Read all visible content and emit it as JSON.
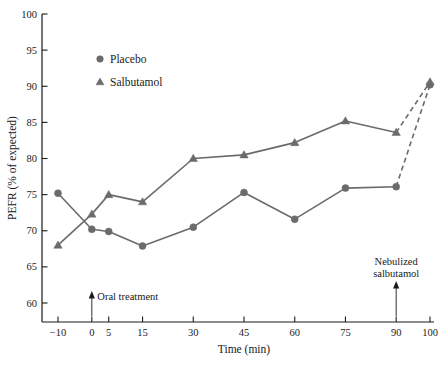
{
  "chart_data": {
    "type": "line",
    "title": "",
    "xlabel": "Time (min)",
    "ylabel": "PEFR (% of expected)",
    "xlim": [
      -14,
      104
    ],
    "ylim": [
      57,
      100
    ],
    "xticks": [
      -10,
      0,
      5,
      15,
      30,
      45,
      60,
      75,
      90,
      100
    ],
    "xtick_labels": [
      "−10",
      "0",
      "5",
      "15",
      "30",
      "45",
      "60",
      "75",
      "90",
      "100"
    ],
    "yticks": [
      60,
      65,
      70,
      75,
      80,
      85,
      90,
      95,
      100
    ],
    "ytick_labels": [
      "60",
      "65",
      "70",
      "75",
      "80",
      "85",
      "90",
      "95",
      "100"
    ],
    "grid": false,
    "legend_position": "upper-left-inside",
    "x": [
      -10,
      0,
      5,
      15,
      30,
      45,
      60,
      75,
      90,
      100
    ],
    "series": [
      {
        "name": "Placebo",
        "marker": "circle",
        "color": "#6b6b6b",
        "values": [
          75.2,
          70.2,
          69.9,
          67.9,
          70.5,
          75.3,
          71.6,
          75.9,
          76.1,
          90.2
        ],
        "dashed_from_index": 8
      },
      {
        "name": "Salbutamol",
        "marker": "triangle",
        "color": "#6b6b6b",
        "values": [
          68.0,
          72.3,
          75.0,
          74.0,
          80.0,
          80.5,
          82.2,
          85.2,
          83.6,
          90.6
        ],
        "dashed_from_index": 8
      }
    ],
    "annotations": [
      {
        "text": "Oral treatment",
        "x": 0,
        "arrow": "up"
      },
      {
        "text_line1": "Nebulized",
        "text_line2": "salbutamol",
        "x": 90,
        "arrow": "up"
      }
    ]
  },
  "legend": {
    "items": [
      {
        "label": "Placebo",
        "marker": "circle"
      },
      {
        "label": "Salbutamol",
        "marker": "triangle"
      }
    ]
  },
  "annotations": {
    "oral_treatment": "Oral treatment",
    "nebulized_line1": "Nebulized",
    "nebulized_line2": "salbutamol"
  },
  "colors": {
    "series": "#6b6b6b",
    "axis": "#1a1a1a",
    "text": "#1a1a1a",
    "background": "#ffffff"
  }
}
